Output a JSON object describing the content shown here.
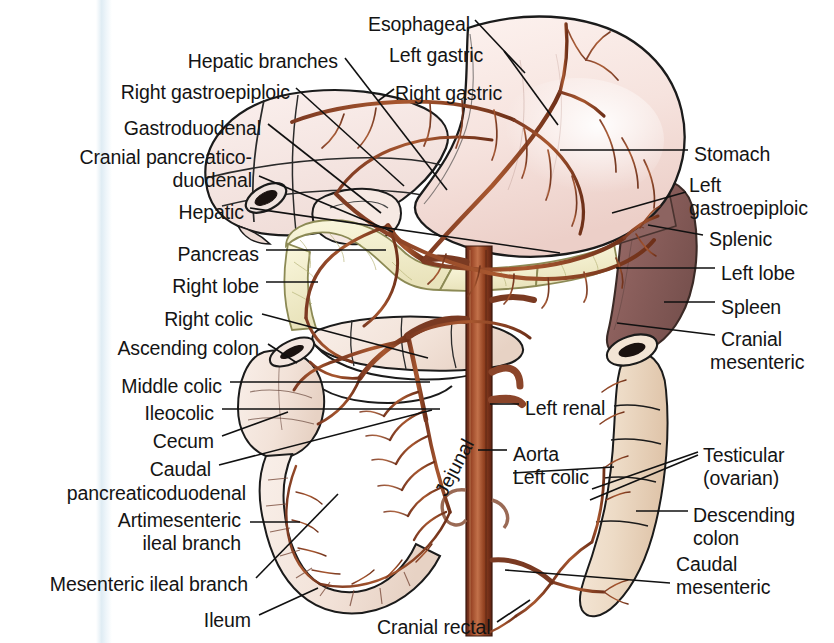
{
  "figure": {
    "background_color": "#ffffff",
    "text_color": "#141414",
    "artery_color": "#7a3a26",
    "aorta_color": "#8e3c22",
    "organ_colors": {
      "liver": "#f6e4e0",
      "stomach": "#f7e6e2",
      "pancreas": "#f4f0cf",
      "spleen": "#8e625f",
      "intestine": "#f3e7e1",
      "colon": "#ecd9c6",
      "duodenum": "#f5e9e3"
    }
  },
  "labels_left": [
    {
      "id": "hepatic-branches",
      "text": "Hepatic branches",
      "x": 338,
      "y": 50,
      "align": "right"
    },
    {
      "id": "right-gastroepiploic",
      "text": "Right gastroepiploic",
      "x": 290,
      "y": 81,
      "align": "right"
    },
    {
      "id": "gastroduodenal",
      "text": "Gastroduodenal",
      "x": 261,
      "y": 117,
      "align": "right"
    },
    {
      "id": "cranial-pancreaticoduodenal-l1",
      "text": "Cranial pancreatico-",
      "x": 252,
      "y": 146,
      "align": "right"
    },
    {
      "id": "cranial-pancreaticoduodenal-l2",
      "text": "duodenal",
      "x": 252,
      "y": 169,
      "align": "right"
    },
    {
      "id": "hepatic",
      "text": "Hepatic",
      "x": 244,
      "y": 201,
      "align": "right"
    },
    {
      "id": "pancreas",
      "text": "Pancreas",
      "x": 259,
      "y": 243,
      "align": "right"
    },
    {
      "id": "right-lobe",
      "text": "Right lobe",
      "x": 259,
      "y": 275,
      "align": "right"
    },
    {
      "id": "right-colic",
      "text": "Right colic",
      "x": 253,
      "y": 308,
      "align": "right"
    },
    {
      "id": "ascending-colon",
      "text": "Ascending colon",
      "x": 259,
      "y": 337,
      "align": "right"
    },
    {
      "id": "middle-colic",
      "text": "Middle colic",
      "x": 222,
      "y": 375,
      "align": "right"
    },
    {
      "id": "ileocolic",
      "text": "Ileocolic",
      "x": 214,
      "y": 402,
      "align": "right"
    },
    {
      "id": "cecum",
      "text": "Cecum",
      "x": 214,
      "y": 430,
      "align": "right"
    },
    {
      "id": "caudal-pancreaticoduodenal-l1",
      "text": "Caudal",
      "x": 211,
      "y": 458,
      "align": "right"
    },
    {
      "id": "caudal-pancreaticoduodenal-l2",
      "text": "pancreaticoduodenal",
      "x": 246,
      "y": 482,
      "align": "right"
    },
    {
      "id": "antimesenteric-ileal-branch-l1",
      "text": "Artimesenteric",
      "x": 241,
      "y": 509,
      "align": "right"
    },
    {
      "id": "antimesenteric-ileal-branch-l2",
      "text": "ileal branch",
      "x": 241,
      "y": 532,
      "align": "right"
    },
    {
      "id": "mesenteric-ileal-branch",
      "text": "Mesenteric ileal branch",
      "x": 248,
      "y": 573,
      "align": "right"
    },
    {
      "id": "ileum",
      "text": "Ileum",
      "x": 251,
      "y": 609,
      "align": "right"
    }
  ],
  "labels_top": [
    {
      "id": "esophageal",
      "text": "Esophageal",
      "x": 368,
      "y": 13,
      "align": "left"
    },
    {
      "id": "left-gastric",
      "text": "Left gastric",
      "x": 389,
      "y": 44,
      "align": "left"
    },
    {
      "id": "right-gastric",
      "text": "Right gastric",
      "x": 395,
      "y": 82,
      "align": "left"
    }
  ],
  "labels_right": [
    {
      "id": "stomach",
      "text": "Stomach",
      "x": 694,
      "y": 143,
      "align": "left"
    },
    {
      "id": "left-gastroepiploic-l1",
      "text": "Left",
      "x": 689,
      "y": 174,
      "align": "left"
    },
    {
      "id": "left-gastroepiploic-l2",
      "text": "gastroepiploic",
      "x": 689,
      "y": 197,
      "align": "left"
    },
    {
      "id": "splenic",
      "text": "Splenic",
      "x": 709,
      "y": 228,
      "align": "left"
    },
    {
      "id": "left-lobe",
      "text": "Left lobe",
      "x": 721,
      "y": 262,
      "align": "left"
    },
    {
      "id": "spleen",
      "text": "Spleen",
      "x": 721,
      "y": 296,
      "align": "left"
    },
    {
      "id": "cranial-mesenteric-l1",
      "text": "Cranial",
      "x": 721,
      "y": 328,
      "align": "left"
    },
    {
      "id": "cranial-mesenteric-l2",
      "text": "mesenteric",
      "x": 710,
      "y": 351,
      "align": "left"
    },
    {
      "id": "testicular-l1",
      "text": "Testicular",
      "x": 703,
      "y": 444,
      "align": "left"
    },
    {
      "id": "testicular-l2",
      "text": "(ovarian)",
      "x": 703,
      "y": 467,
      "align": "left"
    },
    {
      "id": "descending-colon-l1",
      "text": "Descending",
      "x": 693,
      "y": 504,
      "align": "left"
    },
    {
      "id": "descending-colon-l2",
      "text": "colon",
      "x": 693,
      "y": 527,
      "align": "left"
    },
    {
      "id": "caudal-mesenteric-l1",
      "text": "Caudal",
      "x": 676,
      "y": 553,
      "align": "left"
    },
    {
      "id": "caudal-mesenteric-l2",
      "text": "mesenteric",
      "x": 676,
      "y": 576,
      "align": "left"
    }
  ],
  "labels_center": [
    {
      "id": "left-renal",
      "text": "Left renal",
      "x": 525,
      "y": 397,
      "align": "left"
    },
    {
      "id": "aorta",
      "text": "Aorta",
      "x": 513,
      "y": 443,
      "align": "left"
    },
    {
      "id": "left-colic",
      "text": "Left colic",
      "x": 513,
      "y": 466,
      "align": "left"
    },
    {
      "id": "jejunal",
      "text": "Jejunal",
      "x": 430,
      "y": 489,
      "align": "left",
      "rotated": true
    },
    {
      "id": "cranial-rectal",
      "text": "Cranial rectal",
      "x": 377,
      "y": 616,
      "align": "left"
    }
  ],
  "leader_lines": [
    {
      "id": "leader-hepatic-branches",
      "from": [
        345,
        58
      ],
      "to": [
        447,
        190
      ]
    },
    {
      "id": "leader-right-gastroepiploic",
      "from": [
        296,
        88
      ],
      "to": [
        404,
        186
      ]
    },
    {
      "id": "leader-gastroduodenal",
      "from": [
        268,
        124
      ],
      "to": [
        381,
        213
      ]
    },
    {
      "id": "leader-cranial-pd",
      "from": [
        259,
        176
      ],
      "to": [
        393,
        232
      ]
    },
    {
      "id": "leader-hepatic",
      "from": [
        250,
        208
      ],
      "to": [
        560,
        253
      ]
    },
    {
      "id": "leader-pancreas",
      "from": [
        266,
        250
      ],
      "to": [
        386,
        250
      ]
    },
    {
      "id": "leader-right-lobe",
      "from": [
        266,
        282
      ],
      "to": [
        318,
        282
      ]
    },
    {
      "id": "leader-right-colic",
      "from": [
        262,
        314
      ],
      "to": [
        428,
        358
      ]
    },
    {
      "id": "leader-ascending-colon",
      "from": [
        268,
        344
      ],
      "to": [
        297,
        363
      ]
    },
    {
      "id": "leader-middle-colic",
      "from": [
        230,
        382
      ],
      "to": [
        430,
        382
      ]
    },
    {
      "id": "leader-ileocolic",
      "from": [
        222,
        409
      ],
      "to": [
        440,
        409
      ]
    },
    {
      "id": "leader-cecum",
      "from": [
        222,
        436
      ],
      "to": [
        288,
        412
      ]
    },
    {
      "id": "leader-caudal-pd",
      "from": [
        219,
        465
      ],
      "to": [
        432,
        410
      ]
    },
    {
      "id": "leader-antimesenteric",
      "from": [
        250,
        522
      ],
      "to": [
        300,
        522
      ]
    },
    {
      "id": "leader-mesenteric-ileal",
      "from": [
        256,
        578
      ],
      "to": [
        338,
        494
      ]
    },
    {
      "id": "leader-ileum",
      "from": [
        259,
        615
      ],
      "to": [
        318,
        588
      ]
    },
    {
      "id": "leader-esophageal",
      "from": [
        475,
        20
      ],
      "to": [
        525,
        73
      ]
    },
    {
      "id": "leader-left-gastric",
      "from": [
        504,
        51
      ],
      "to": [
        558,
        125
      ]
    },
    {
      "id": "leader-right-gastric",
      "from": [
        394,
        89
      ],
      "to": [
        378,
        101
      ]
    },
    {
      "id": "leader-stomach",
      "from": [
        688,
        150
      ],
      "to": [
        560,
        150
      ]
    },
    {
      "id": "leader-left-gastroepiploic",
      "from": [
        686,
        192
      ],
      "to": [
        612,
        213
      ]
    },
    {
      "id": "leader-splenic",
      "from": [
        703,
        235
      ],
      "to": [
        648,
        225
      ]
    },
    {
      "id": "leader-left-lobe-r",
      "from": [
        715,
        268
      ],
      "to": [
        616,
        268
      ]
    },
    {
      "id": "leader-spleen",
      "from": [
        715,
        302
      ],
      "to": [
        664,
        302
      ]
    },
    {
      "id": "leader-cranial-mesenteric",
      "from": [
        715,
        335
      ],
      "to": [
        617,
        323
      ]
    },
    {
      "id": "leader-testicular-a",
      "from": [
        698,
        452
      ],
      "to": [
        592,
        489
      ]
    },
    {
      "id": "leader-testicular-b",
      "from": [
        698,
        455
      ],
      "to": [
        590,
        500
      ]
    },
    {
      "id": "leader-descending-colon",
      "from": [
        688,
        511
      ],
      "to": [
        636,
        511
      ]
    },
    {
      "id": "leader-caudal-mesenteric",
      "from": [
        670,
        583
      ],
      "to": [
        505,
        570
      ]
    },
    {
      "id": "leader-left-renal",
      "from": [
        519,
        404
      ],
      "to": [
        490,
        404
      ]
    },
    {
      "id": "leader-aorta",
      "from": [
        507,
        450
      ],
      "to": [
        478,
        450
      ]
    },
    {
      "id": "leader-left-colic",
      "from": [
        513,
        473
      ],
      "to": [
        614,
        467
      ]
    },
    {
      "id": "leader-cranial-rectal",
      "from": [
        497,
        622
      ],
      "to": [
        530,
        600
      ]
    }
  ]
}
